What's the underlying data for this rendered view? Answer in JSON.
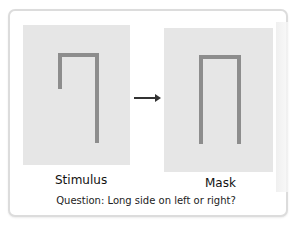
{
  "figure": {
    "stimulus": {
      "label": "Stimulus",
      "shape": "inverted-J / hook: top bar with short left side and long right side"
    },
    "mask": {
      "label": "Mask",
      "shape": "inverted U: top bar with two equal long sides"
    },
    "arrow": "right-arrow",
    "question": "Question: Long side on left or right?"
  },
  "colors": {
    "panel": "#e6e6e6",
    "stroke": "#8d8d8d",
    "arrow": "#333333",
    "border": "#dcdcdc"
  }
}
